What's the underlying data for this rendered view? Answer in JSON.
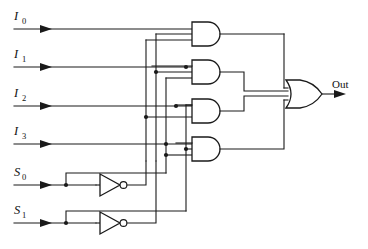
{
  "diagram": {
    "type": "logic-circuit",
    "line_color": "#1a1a1a",
    "background_color": "#ffffff"
  },
  "inputs": [
    {
      "name": "I0",
      "base": "I",
      "sub": "0",
      "y": 29
    },
    {
      "name": "I1",
      "base": "I",
      "sub": "1",
      "y": 67
    },
    {
      "name": "I2",
      "base": "I",
      "sub": "2",
      "y": 106
    },
    {
      "name": "I3",
      "base": "I",
      "sub": "3",
      "y": 144
    }
  ],
  "selects": [
    {
      "name": "S0",
      "base": "S",
      "sub": "0",
      "y": 185
    },
    {
      "name": "S1",
      "base": "S",
      "sub": "1",
      "y": 223
    }
  ],
  "inverters": [
    {
      "name": "not-s0",
      "label": "NOT",
      "input": "S0",
      "output": "S0_bar"
    },
    {
      "name": "not-s1",
      "label": "NOT",
      "input": "S1",
      "output": "S1_bar"
    }
  ],
  "and_gates": [
    {
      "name": "and-gate-1",
      "label": "AND",
      "inputs": [
        "I0",
        "S1_bar",
        "S0_bar"
      ],
      "y": 34
    },
    {
      "name": "and-gate-2",
      "label": "AND",
      "inputs": [
        "I1",
        "S1_bar",
        "S0"
      ],
      "y": 72
    },
    {
      "name": "and-gate-3",
      "label": "AND",
      "inputs": [
        "I2",
        "S1",
        "S0_bar"
      ],
      "y": 111
    },
    {
      "name": "and-gate-4",
      "label": "AND",
      "inputs": [
        "I3",
        "S1",
        "S0"
      ],
      "y": 149
    }
  ],
  "or_gate": {
    "name": "or-gate",
    "label": "OR",
    "inputs": [
      "and-gate-1",
      "and-gate-2",
      "and-gate-3",
      "and-gate-4"
    ],
    "y": 94
  },
  "output": {
    "name": "Out",
    "label": "Out",
    "x": 332,
    "y": 90
  }
}
